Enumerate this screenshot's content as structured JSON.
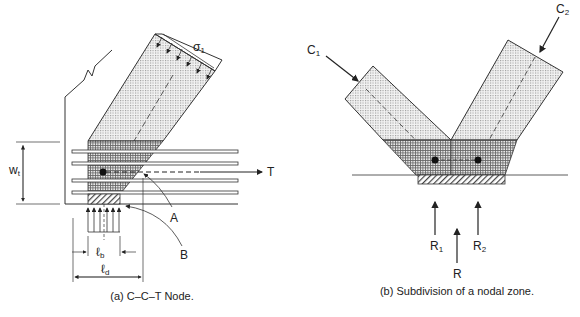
{
  "figure_a": {
    "caption": "(a) C–C–T Node.",
    "labels": {
      "stress": "σ",
      "stress_sub": "1",
      "tension": "T",
      "point_a": "A",
      "point_b": "B",
      "width": "w",
      "width_sub": "t",
      "lb": "ℓ",
      "lb_sub": "b",
      "ld": "ℓ",
      "ld_sub": "d"
    }
  },
  "figure_b": {
    "caption": "(b) Subdivision of a nodal zone.",
    "labels": {
      "c1": "C",
      "c1_sub": "1",
      "c2": "C",
      "c2_sub": "2",
      "r1": "R",
      "r1_sub": "1",
      "r2": "R",
      "r2_sub": "2",
      "r": "R"
    }
  },
  "colors": {
    "line": "#333333",
    "strut_fill": "#eeeeee",
    "node_fill": "#cfcfcf"
  }
}
